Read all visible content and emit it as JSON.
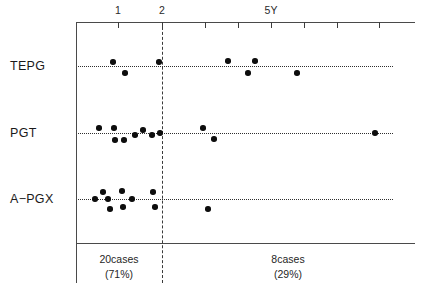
{
  "chart_data": {
    "type": "scatter",
    "title": "",
    "xlabel": "",
    "ylabel": "",
    "xlim": [
      0,
      7.7
    ],
    "grid": false,
    "legend": null,
    "axis": {
      "tick_values": [
        1,
        2,
        3,
        4,
        5,
        6,
        7
      ],
      "tick_labels": [
        "1",
        "2",
        "",
        "",
        "5Y",
        "",
        ""
      ],
      "visible_tick_labels": [
        "1",
        "2",
        "5Y"
      ]
    },
    "divider": {
      "value": 2,
      "style": "dashed"
    },
    "categories": [
      "TEPG",
      "PGT",
      "A−PGX"
    ],
    "series": [
      {
        "name": "TEPG",
        "points": [
          {
            "x": 0.84,
            "y": 0.28
          },
          {
            "x": 1.12,
            "y": -0.28
          },
          {
            "x": 1.89,
            "y": 0.28
          },
          {
            "x": 3.45,
            "y": 0.33
          },
          {
            "x": 3.91,
            "y": -0.28
          },
          {
            "x": 4.07,
            "y": 0.33
          },
          {
            "x": 5.02,
            "y": -0.28
          }
        ]
      },
      {
        "name": "PGT",
        "points": [
          {
            "x": 0.52,
            "y": 0.28
          },
          {
            "x": 0.86,
            "y": 0.28
          },
          {
            "x": 0.89,
            "y": -0.33
          },
          {
            "x": 1.09,
            "y": -0.33
          },
          {
            "x": 1.34,
            "y": -0.05
          },
          {
            "x": 1.52,
            "y": 0.11
          },
          {
            "x": 1.73,
            "y": -0.05
          },
          {
            "x": 1.91,
            "y": 0.0
          },
          {
            "x": 2.89,
            "y": 0.28
          },
          {
            "x": 3.14,
            "y": -0.28
          },
          {
            "x": 6.79,
            "y": 0.0
          }
        ]
      },
      {
        "name": "A−PGX",
        "points": [
          {
            "x": 0.43,
            "y": 0.0
          },
          {
            "x": 0.61,
            "y": 0.33
          },
          {
            "x": 0.73,
            "y": 0.0
          },
          {
            "x": 0.77,
            "y": -0.28
          },
          {
            "x": 1.05,
            "y": 0.39
          },
          {
            "x": 1.07,
            "y": -0.22
          },
          {
            "x": 1.27,
            "y": 0.0
          },
          {
            "x": 1.75,
            "y": 0.33
          },
          {
            "x": 1.8,
            "y": -0.22
          },
          {
            "x": 3.02,
            "y": -0.28
          }
        ]
      }
    ],
    "groups": [
      {
        "label": "20cases",
        "pct": "(71%)",
        "range": [
          0,
          2
        ],
        "count": 20,
        "percent": 71
      },
      {
        "label": "8cases",
        "pct": "(29%)",
        "range": [
          2,
          7.7
        ],
        "count": 8,
        "percent": 29
      }
    ]
  },
  "axis": {
    "ticks": [
      {
        "label": "1",
        "x": 118
      },
      {
        "label": "2",
        "x": 162
      },
      {
        "label": "",
        "x": 205
      },
      {
        "label": "",
        "x": 238
      },
      {
        "label": "5Y",
        "x": 271
      },
      {
        "label": "",
        "x": 304
      },
      {
        "label": "",
        "x": 337
      },
      {
        "label": "",
        "x": 379
      }
    ]
  },
  "rows": [
    {
      "label": "TEPG",
      "y": 66,
      "points": [
        {
          "x": 113,
          "y": 62
        },
        {
          "x": 125,
          "y": 73
        },
        {
          "x": 159,
          "y": 62
        },
        {
          "x": 228,
          "y": 61
        },
        {
          "x": 248,
          "y": 73
        },
        {
          "x": 255,
          "y": 61
        },
        {
          "x": 297,
          "y": 73
        }
      ]
    },
    {
      "label": "PGT",
      "y": 133,
      "points": [
        {
          "x": 99,
          "y": 128
        },
        {
          "x": 114,
          "y": 128
        },
        {
          "x": 115,
          "y": 140
        },
        {
          "x": 124,
          "y": 140
        },
        {
          "x": 135,
          "y": 135
        },
        {
          "x": 143,
          "y": 130
        },
        {
          "x": 152,
          "y": 135
        },
        {
          "x": 160,
          "y": 133
        },
        {
          "x": 203,
          "y": 128
        },
        {
          "x": 214,
          "y": 139
        },
        {
          "x": 375,
          "y": 133
        }
      ]
    },
    {
      "label": "A−PGX",
      "y": 199,
      "points": [
        {
          "x": 95,
          "y": 199
        },
        {
          "x": 103,
          "y": 192
        },
        {
          "x": 108,
          "y": 199
        },
        {
          "x": 110,
          "y": 209
        },
        {
          "x": 122,
          "y": 191
        },
        {
          "x": 123,
          "y": 207
        },
        {
          "x": 132,
          "y": 199
        },
        {
          "x": 153,
          "y": 192
        },
        {
          "x": 155,
          "y": 207
        },
        {
          "x": 208,
          "y": 209
        }
      ]
    }
  ],
  "groups": [
    {
      "label": "20cases",
      "pct": "(71%)",
      "x": 119,
      "y": 252
    },
    {
      "label": "8cases",
      "pct": "(29%)",
      "x": 288,
      "y": 252
    }
  ]
}
